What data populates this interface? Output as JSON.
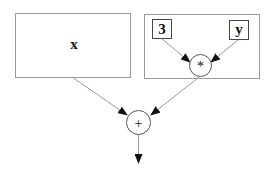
{
  "diagram": {
    "type": "expression-tree",
    "nodes": {
      "x_box": {
        "label": "x"
      },
      "three": {
        "label": "3"
      },
      "y": {
        "label": "y"
      },
      "mult": {
        "label": "*"
      },
      "plus": {
        "label": "+"
      }
    },
    "edges": [
      {
        "from": "3",
        "to": "*"
      },
      {
        "from": "y",
        "to": "*"
      },
      {
        "from": "x",
        "to": "+"
      },
      {
        "from": "*",
        "to": "+"
      },
      {
        "from": "+",
        "to": "output"
      }
    ],
    "colors": {
      "stroke": "#888888",
      "arrow": "#111111",
      "text": "#111111"
    }
  }
}
